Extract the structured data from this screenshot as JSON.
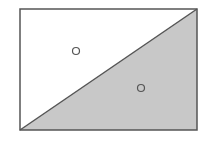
{
  "diagram": {
    "rectangle": {
      "x": 20,
      "y": 9,
      "width": 177,
      "height": 121,
      "stroke": "#555555"
    },
    "diagonal": {
      "from": "bottom-left",
      "to": "top-right"
    },
    "regions": [
      {
        "name": "upper-left-triangle",
        "fill": "#ffffff"
      },
      {
        "name": "lower-right-triangle",
        "fill": "#c8c8c8"
      }
    ],
    "points": [
      {
        "name": "point-in-white-region",
        "cx": 76,
        "cy": 51,
        "r": 3.5
      },
      {
        "name": "point-in-shaded-region",
        "cx": 141,
        "cy": 88,
        "r": 3.5
      }
    ]
  }
}
